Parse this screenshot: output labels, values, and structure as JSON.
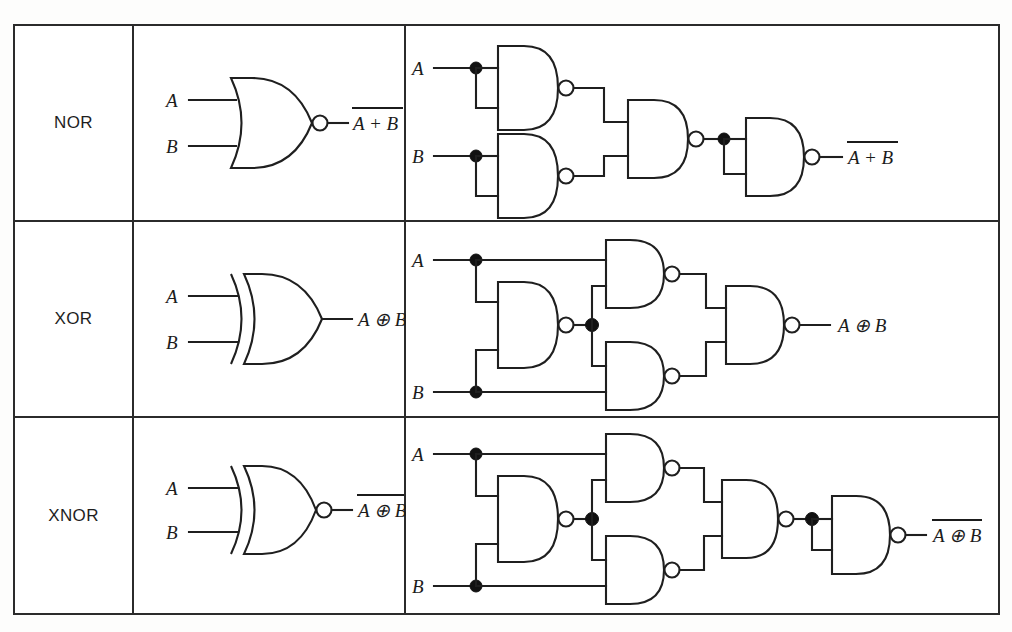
{
  "figure": {
    "ink_color": "#1f1f1f",
    "border_color": "#2b2b2b",
    "background": "#ffffff",
    "columns": [
      "Gate",
      "Standard symbol",
      "NAND-only equivalent circuit"
    ]
  },
  "inputs": {
    "a": "A",
    "b": "B"
  },
  "rows": [
    {
      "name": "NOR",
      "symbol": {
        "kind": "nor-gate",
        "inputs": [
          "A",
          "B"
        ],
        "output_expr": "A + B",
        "output_overbar": true,
        "has_bubble": true
      },
      "equivalent": {
        "gate_count": 4,
        "gates": [
          {
            "id": "n1",
            "role": "inverter-A",
            "inputs": [
              "A",
              "A"
            ]
          },
          {
            "id": "n2",
            "role": "inverter-B",
            "inputs": [
              "B",
              "B"
            ]
          },
          {
            "id": "n3",
            "role": "combiner",
            "inputs": [
              "n1",
              "n2"
            ]
          },
          {
            "id": "n4",
            "role": "inverter-out",
            "inputs": [
              "n3",
              "n3"
            ]
          }
        ],
        "output_expr": "A + B",
        "output_overbar": true
      }
    },
    {
      "name": "XOR",
      "symbol": {
        "kind": "xor-gate",
        "inputs": [
          "A",
          "B"
        ],
        "output_expr": "A ⊕ B",
        "output_overbar": false,
        "has_bubble": false
      },
      "equivalent": {
        "gate_count": 4,
        "gates": [
          {
            "id": "n1",
            "role": "mid",
            "inputs": [
              "A",
              "B"
            ]
          },
          {
            "id": "n2",
            "role": "upper",
            "inputs": [
              "A",
              "n1"
            ]
          },
          {
            "id": "n3",
            "role": "lower",
            "inputs": [
              "n1",
              "B"
            ]
          },
          {
            "id": "n4",
            "role": "output",
            "inputs": [
              "n2",
              "n3"
            ]
          }
        ],
        "output_expr": "A ⊕ B",
        "output_overbar": false
      }
    },
    {
      "name": "XNOR",
      "symbol": {
        "kind": "xnor-gate",
        "inputs": [
          "A",
          "B"
        ],
        "output_expr": "A ⊕ B",
        "output_overbar": true,
        "has_bubble": true
      },
      "equivalent": {
        "gate_count": 5,
        "gates": [
          {
            "id": "n1",
            "role": "mid",
            "inputs": [
              "A",
              "B"
            ]
          },
          {
            "id": "n2",
            "role": "upper",
            "inputs": [
              "A",
              "n1"
            ]
          },
          {
            "id": "n3",
            "role": "lower",
            "inputs": [
              "n1",
              "B"
            ]
          },
          {
            "id": "n4",
            "role": "xor-output",
            "inputs": [
              "n2",
              "n3"
            ]
          },
          {
            "id": "n5",
            "role": "inverter-out",
            "inputs": [
              "n4",
              "n4"
            ]
          }
        ],
        "output_expr": "A ⊕ B",
        "output_overbar": true
      }
    }
  ]
}
